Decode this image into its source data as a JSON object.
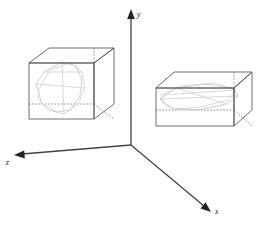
{
  "figure": {
    "title": "",
    "background_color": "#ffffff",
    "width": 262,
    "height": 225
  },
  "axes": {
    "origin": {
      "x": 131,
      "y": 145
    },
    "color": "#444444",
    "arrow_color": "#222222",
    "items": [
      {
        "name": "y-axis",
        "label": "y",
        "label_x": 139,
        "label_y": 16,
        "direction": "up",
        "start_x": 131,
        "start_y": 145,
        "end_x": 131,
        "end_y": 12
      },
      {
        "name": "x-axis",
        "label": "x",
        "label_x": 217,
        "label_y": 212,
        "direction": "down-right",
        "start_x": 131,
        "start_y": 145,
        "end_x": 207,
        "end_y": 209
      },
      {
        "name": "z-axis",
        "label": "z",
        "label_x": 8,
        "label_y": 163,
        "direction": "left",
        "start_x": 131,
        "start_y": 145,
        "end_x": 14,
        "end_y": 156
      }
    ]
  },
  "boxes": [
    {
      "name": "left-box",
      "shape": "cube",
      "edge_color": "#555555",
      "hidden_edge_color": "#777777",
      "front_face": {
        "x": 29,
        "y": 63,
        "w": 65,
        "h": 56
      },
      "depth_dx": 20,
      "depth_dy": -15,
      "slice_color": "#c4c4c4",
      "slice_points": "36,84 44,72 62,62 76,66 82,80 80,96 70,110 56,112 42,104",
      "slice_points_b": "39,89 50,70 70,63 82,72 85,88 78,104 64,114 48,110 38,98"
    },
    {
      "name": "right-box",
      "shape": "rectangular-prism",
      "edge_color": "#555555",
      "hidden_edge_color": "#777777",
      "front_face": {
        "x": 156,
        "y": 88,
        "w": 78,
        "h": 38
      },
      "depth_dx": 18,
      "depth_dy": -16,
      "slice_color": "#c4c4c4",
      "slice_points": "160,99 176,88 206,84 232,88 238,96 226,104 198,110 172,108",
      "slice_points_b": "161,95 182,86 214,83 236,90 228,100 200,107 174,110 163,103"
    }
  ],
  "legend": {
    "visible": false,
    "entries": []
  }
}
